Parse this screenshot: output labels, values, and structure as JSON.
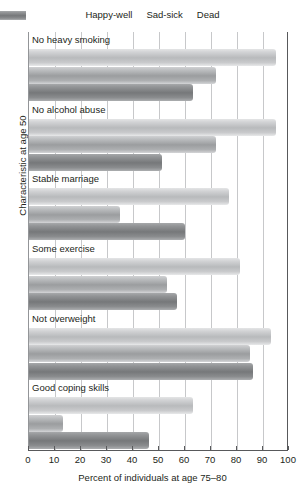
{
  "chart_data": {
    "type": "bar",
    "orientation": "horizontal",
    "title": "",
    "xlabel": "Percent of individuals at age 75–80",
    "ylabel": "Characteristic at age 50",
    "xlim": [
      0,
      100
    ],
    "xticks": [
      0,
      10,
      20,
      30,
      40,
      50,
      60,
      70,
      80,
      90,
      100
    ],
    "xtick_labels": [
      "0",
      "10",
      "20",
      "30",
      "40",
      "50",
      "60",
      "70",
      "80",
      "90",
      "100"
    ],
    "grid": true,
    "legend_position": "top",
    "categories": [
      "No heavy smoking",
      "No alcohol abuse",
      "Stable marriage",
      "Some exercise",
      "Not overweight",
      "Good coping skills"
    ],
    "series": [
      {
        "name": "Happy-well",
        "color": "#b8babc",
        "values": [
          95,
          95,
          77,
          81,
          93,
          63
        ]
      },
      {
        "name": "Sad-sick",
        "color": "#9b9d9f",
        "values": [
          72,
          72,
          35,
          53,
          85,
          13
        ]
      },
      {
        "name": "Dead",
        "color": "#76787a",
        "values": [
          63,
          51,
          60,
          57,
          86,
          46
        ]
      }
    ]
  },
  "legend": {
    "items": [
      {
        "label": "Happy-well",
        "key": "happy"
      },
      {
        "label": "Sad-sick",
        "key": "sad"
      },
      {
        "label": "Dead",
        "key": "dead"
      }
    ]
  },
  "axes": {
    "x_title": "Percent of individuals at age 75–80",
    "y_title": "Characteristic at age 50"
  }
}
